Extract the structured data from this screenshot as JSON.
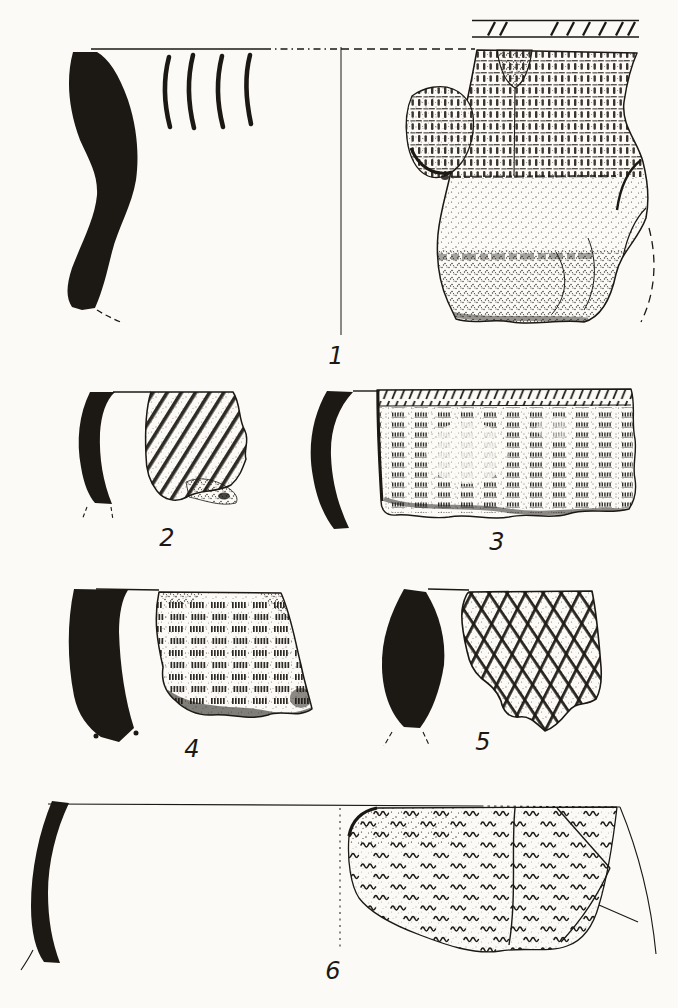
{
  "palette": {
    "ink": "#1c1813",
    "paper": "#fbfaf6"
  },
  "plate": {
    "items": [
      {
        "label": "1"
      },
      {
        "label": "2"
      },
      {
        "label": "3"
      },
      {
        "label": "4"
      },
      {
        "label": "5"
      },
      {
        "label": "6"
      }
    ]
  }
}
